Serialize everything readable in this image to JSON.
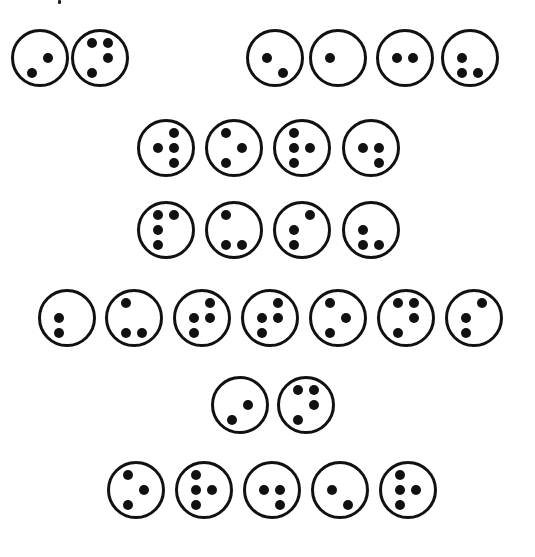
{
  "dot_color": "#111111",
  "cell_diameter": 58,
  "dot_layout": {
    "1": [
      -8,
      -15
    ],
    "2": [
      -8,
      0
    ],
    "3": [
      -8,
      15
    ],
    "4": [
      8,
      -15
    ],
    "5": [
      8,
      0
    ],
    "6": [
      8,
      15
    ]
  },
  "rows": [
    {
      "y": 58,
      "cells": [
        {
          "x": 40,
          "dots": [
            3,
            5
          ]
        },
        {
          "x": 100,
          "dots": [
            1,
            4,
            5,
            3
          ]
        },
        {
          "x": 275,
          "dots": [
            2,
            6
          ]
        },
        {
          "x": 338,
          "dots": [
            2
          ]
        },
        {
          "x": 405,
          "dots": [
            2,
            5
          ]
        },
        {
          "x": 470,
          "dots": [
            2,
            3,
            6
          ]
        }
      ]
    },
    {
      "y": 148,
      "cells": [
        {
          "x": 166,
          "dots": [
            4,
            2,
            5,
            6
          ]
        },
        {
          "x": 234,
          "dots": [
            1,
            5,
            3
          ]
        },
        {
          "x": 302,
          "dots": [
            1,
            2,
            5,
            3
          ]
        },
        {
          "x": 371,
          "dots": [
            2,
            5,
            6
          ]
        }
      ]
    },
    {
      "y": 230,
      "cells": [
        {
          "x": 166,
          "dots": [
            1,
            4,
            2,
            3
          ]
        },
        {
          "x": 234,
          "dots": [
            1,
            3,
            6
          ]
        },
        {
          "x": 302,
          "dots": [
            4,
            2,
            3
          ]
        },
        {
          "x": 371,
          "dots": [
            2,
            3,
            6
          ]
        }
      ]
    },
    {
      "y": 318,
      "cells": [
        {
          "x": 67,
          "dots": [
            2,
            3
          ]
        },
        {
          "x": 134,
          "dots": [
            1,
            3,
            6
          ]
        },
        {
          "x": 202,
          "dots": [
            4,
            2,
            5,
            3
          ]
        },
        {
          "x": 270,
          "dots": [
            4,
            2,
            5,
            3
          ]
        },
        {
          "x": 338,
          "dots": [
            1,
            5,
            3
          ]
        },
        {
          "x": 406,
          "dots": [
            1,
            4,
            5,
            3
          ]
        },
        {
          "x": 474,
          "dots": [
            4,
            2,
            3
          ]
        }
      ]
    },
    {
      "y": 405,
      "cells": [
        {
          "x": 240,
          "dots": [
            5,
            3
          ]
        },
        {
          "x": 306,
          "dots": [
            1,
            4,
            5,
            3
          ]
        }
      ]
    },
    {
      "y": 490,
      "cells": [
        {
          "x": 136,
          "dots": [
            1,
            5,
            3
          ]
        },
        {
          "x": 204,
          "dots": [
            1,
            2,
            5,
            3
          ]
        },
        {
          "x": 272,
          "dots": [
            2,
            5,
            6
          ]
        },
        {
          "x": 340,
          "dots": [
            2,
            6
          ]
        },
        {
          "x": 408,
          "dots": [
            1,
            2,
            5,
            3
          ]
        }
      ]
    }
  ]
}
